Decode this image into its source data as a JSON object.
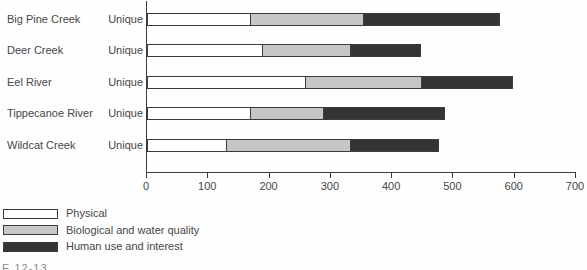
{
  "figure": {
    "background": "#fefefe",
    "caption_fragment": "E 12-13"
  },
  "chart_data": {
    "type": "bar",
    "subtype": "horizontal-stacked",
    "title": "",
    "categories": [
      "Big Pine Creek",
      "Deer Creek",
      "Eel River",
      "Tippecanoe River",
      "Wildcat Creek"
    ],
    "row_labels": [
      "Unique",
      "Unique",
      "Unique",
      "Unique",
      "Unique"
    ],
    "series": [
      {
        "name": "Physical",
        "color": "#ffffff",
        "values": [
          170,
          190,
          260,
          170,
          130
        ]
      },
      {
        "name": "Biological and water quality",
        "color": "#c5c7c5",
        "values": [
          185,
          145,
          190,
          120,
          205
        ]
      },
      {
        "name": "Human use and interest",
        "color": "#333533",
        "values": [
          225,
          115,
          150,
          200,
          145
        ]
      }
    ],
    "totals": [
      580,
      450,
      600,
      490,
      480
    ],
    "xlabel": "",
    "ylabel": "",
    "xlim": [
      0,
      700
    ],
    "x_ticks": [
      "0",
      "100",
      "200",
      "300",
      "400",
      "500",
      "600",
      "700"
    ],
    "grid": "off",
    "legend_position": "bottom-left",
    "axis_color": "#3d3d3d"
  }
}
